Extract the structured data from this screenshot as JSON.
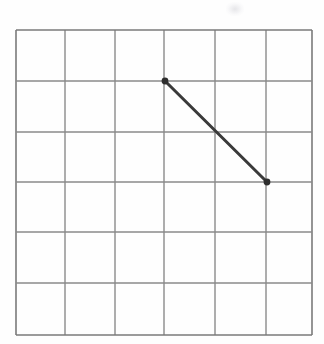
{
  "figure": {
    "title": "",
    "background_color": "#fefefe",
    "width": 324,
    "height": 344
  },
  "grid": {
    "columns": 6,
    "rows": 6,
    "line_color": "#8a8a8a",
    "border_color": "#7a7a7a",
    "line_width": 1.4,
    "border_width": 1.6,
    "x_left": 16,
    "x_right": 312,
    "y_top": 30,
    "y_bottom": 335,
    "cell_width": 49.3,
    "cell_height": 50.8,
    "vertical_line_positions": [
      16,
      65,
      115,
      164,
      215,
      266,
      312
    ],
    "horizontal_line_positions": [
      30,
      81,
      132,
      182,
      232,
      283,
      335
    ]
  },
  "chart_data": {
    "type": "line",
    "title": "",
    "xlabel": "",
    "ylabel": "",
    "xlim": [
      0,
      6
    ],
    "ylim": [
      0,
      6
    ],
    "grid": true,
    "legend": "none",
    "xticks": [
      0,
      1,
      2,
      3,
      4,
      5,
      6
    ],
    "yticks": [
      0,
      1,
      2,
      3,
      4,
      5,
      6
    ],
    "xticklabels": [
      "",
      "",
      "",
      "",
      "",
      "",
      ""
    ],
    "yticklabels": [
      "",
      "",
      "",
      "",
      "",
      "",
      ""
    ],
    "series": [
      {
        "name": "segment",
        "color": "#3a3a3a",
        "line_width": 3,
        "marker": "circle",
        "marker_size": 6,
        "marker_color": "#2e2e2e",
        "x": [
          3,
          5
        ],
        "y": [
          5,
          3
        ],
        "points_px": [
          {
            "x": 165,
            "y": 81
          },
          {
            "x": 267,
            "y": 182
          }
        ]
      }
    ],
    "annotations": []
  },
  "artifacts": {
    "smudge": {
      "name": "scan-smudge",
      "x": 226,
      "y": 2,
      "width": 18,
      "height": 14,
      "color": "#e8e8ea"
    }
  }
}
